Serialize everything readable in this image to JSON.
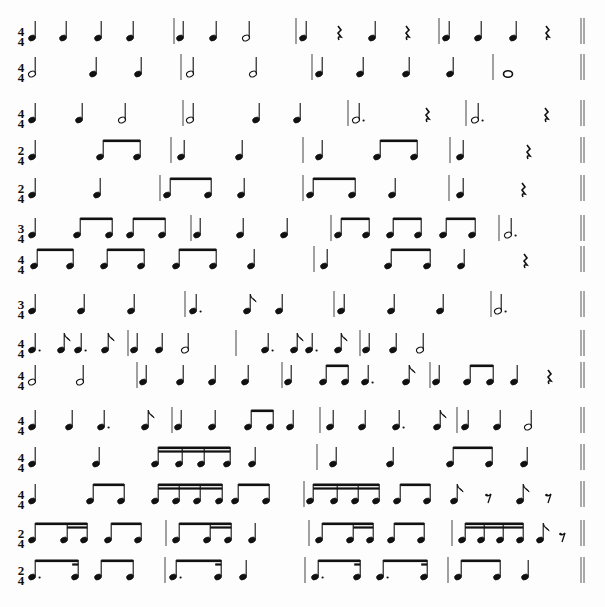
{
  "document": {
    "title": "Rhythm reading exercises",
    "lines": [
      {
        "id": 1,
        "y": 38,
        "time": [
          "4",
          "4"
        ],
        "symbols": [
          {
            "t": "q",
            "x": 32
          },
          {
            "t": "q",
            "x": 63
          },
          {
            "t": "q",
            "x": 98
          },
          {
            "t": "q",
            "x": 130
          },
          {
            "t": "bar",
            "x": 174
          },
          {
            "t": "q",
            "x": 180
          },
          {
            "t": "q",
            "x": 213
          },
          {
            "t": "h",
            "x": 246
          },
          {
            "t": "bar",
            "x": 296
          },
          {
            "t": "q",
            "x": 303
          },
          {
            "t": "qr",
            "x": 339
          },
          {
            "t": "q",
            "x": 372
          },
          {
            "t": "qr",
            "x": 407
          },
          {
            "t": "bar",
            "x": 439
          },
          {
            "t": "q",
            "x": 446
          },
          {
            "t": "q",
            "x": 478
          },
          {
            "t": "q",
            "x": 513
          },
          {
            "t": "qr",
            "x": 547
          },
          {
            "t": "dbl",
            "x": 581
          }
        ]
      },
      {
        "id": 2,
        "y": 74,
        "time": [
          "4",
          "4"
        ],
        "symbols": [
          {
            "t": "h",
            "x": 32
          },
          {
            "t": "q",
            "x": 93
          },
          {
            "t": "q",
            "x": 138
          },
          {
            "t": "bar",
            "x": 181
          },
          {
            "t": "h",
            "x": 190
          },
          {
            "t": "h",
            "x": 253
          },
          {
            "t": "bar",
            "x": 312
          },
          {
            "t": "q",
            "x": 319
          },
          {
            "t": "q",
            "x": 360
          },
          {
            "t": "q",
            "x": 406
          },
          {
            "t": "q",
            "x": 450
          },
          {
            "t": "bar",
            "x": 493
          },
          {
            "t": "w",
            "x": 508
          },
          {
            "t": "dbl",
            "x": 581
          }
        ]
      },
      {
        "id": 3,
        "y": 120,
        "time": [
          "4",
          "4"
        ],
        "symbols": [
          {
            "t": "q",
            "x": 32
          },
          {
            "t": "q",
            "x": 79
          },
          {
            "t": "h",
            "x": 122
          },
          {
            "t": "bar",
            "x": 183
          },
          {
            "t": "h",
            "x": 190
          },
          {
            "t": "q",
            "x": 256
          },
          {
            "t": "q",
            "x": 297
          },
          {
            "t": "bar",
            "x": 348
          },
          {
            "t": "hd",
            "x": 356
          },
          {
            "t": "qr",
            "x": 427
          },
          {
            "t": "bar",
            "x": 466
          },
          {
            "t": "hd",
            "x": 475
          },
          {
            "t": "qr",
            "x": 546
          },
          {
            "t": "dbl",
            "x": 581
          }
        ]
      },
      {
        "id": 4,
        "y": 157,
        "time": [
          "2",
          "4"
        ],
        "symbols": [
          {
            "t": "q",
            "x": 32
          },
          {
            "t": "beam8",
            "x": [
              100,
              137
            ]
          },
          {
            "t": "bar",
            "x": 171
          },
          {
            "t": "q",
            "x": 181
          },
          {
            "t": "q",
            "x": 239
          },
          {
            "t": "bar",
            "x": 303
          },
          {
            "t": "q",
            "x": 319
          },
          {
            "t": "beam8",
            "x": [
              377,
              414
            ]
          },
          {
            "t": "bar",
            "x": 450
          },
          {
            "t": "q",
            "x": 460
          },
          {
            "t": "qr",
            "x": 528
          },
          {
            "t": "dbl",
            "x": 581
          }
        ]
      },
      {
        "id": 5,
        "y": 195,
        "time": [
          "2",
          "4"
        ],
        "symbols": [
          {
            "t": "q",
            "x": 32
          },
          {
            "t": "q",
            "x": 97
          },
          {
            "t": "bar",
            "x": 160
          },
          {
            "t": "beam8",
            "x": [
              167,
              208
            ]
          },
          {
            "t": "q",
            "x": 241
          },
          {
            "t": "bar",
            "x": 303
          },
          {
            "t": "beam8",
            "x": [
              310,
              352
            ]
          },
          {
            "t": "q",
            "x": 392
          },
          {
            "t": "bar",
            "x": 449
          },
          {
            "t": "q",
            "x": 460
          },
          {
            "t": "qr",
            "x": 523
          },
          {
            "t": "dbl",
            "x": 581
          }
        ]
      },
      {
        "id": 6,
        "y": 235,
        "time": [
          "3",
          "4"
        ],
        "symbols": [
          {
            "t": "q",
            "x": 32
          },
          {
            "t": "beam8",
            "x": [
              77,
              109
            ]
          },
          {
            "t": "beam8",
            "x": [
              130,
              162
            ]
          },
          {
            "t": "bar",
            "x": 191
          },
          {
            "t": "q",
            "x": 197
          },
          {
            "t": "q",
            "x": 240
          },
          {
            "t": "q",
            "x": 284
          },
          {
            "t": "bar",
            "x": 331
          },
          {
            "t": "beam8",
            "x": [
              338,
              366
            ]
          },
          {
            "t": "beam8",
            "x": [
              390,
              418
            ]
          },
          {
            "t": "beam8",
            "x": [
              443,
              472
            ]
          },
          {
            "t": "bar",
            "x": 499
          },
          {
            "t": "hd",
            "x": 508
          },
          {
            "t": "dbl",
            "x": 581
          }
        ]
      },
      {
        "id": 7,
        "y": 266,
        "time": [
          "4",
          "4"
        ],
        "symbols": [
          {
            "t": "beam8",
            "x": [
              34,
              70
            ]
          },
          {
            "t": "beam8",
            "x": [
              104,
              141
            ]
          },
          {
            "t": "beam8",
            "x": [
              176,
              213
            ]
          },
          {
            "t": "q",
            "x": 251
          },
          {
            "t": "bar",
            "x": 314
          },
          {
            "t": "q",
            "x": 324
          },
          {
            "t": "beam8",
            "x": [
              388,
              427
            ]
          },
          {
            "t": "q",
            "x": 461
          },
          {
            "t": "qr",
            "x": 525
          },
          {
            "t": "dbl",
            "x": 581
          }
        ]
      },
      {
        "id": 8,
        "y": 311,
        "time": [
          "3",
          "4"
        ],
        "symbols": [
          {
            "t": "q",
            "x": 32
          },
          {
            "t": "q",
            "x": 81
          },
          {
            "t": "q",
            "x": 131
          },
          {
            "t": "bar",
            "x": 185
          },
          {
            "t": "qd",
            "x": 193
          },
          {
            "t": "e",
            "x": 247
          },
          {
            "t": "q",
            "x": 279
          },
          {
            "t": "bar",
            "x": 334
          },
          {
            "t": "q",
            "x": 341
          },
          {
            "t": "q",
            "x": 391
          },
          {
            "t": "q",
            "x": 440
          },
          {
            "t": "bar",
            "x": 491
          },
          {
            "t": "hd",
            "x": 498
          },
          {
            "t": "dbl",
            "x": 581
          }
        ]
      },
      {
        "id": 9,
        "y": 350,
        "time": [
          "4",
          "4"
        ],
        "symbols": [
          {
            "t": "qd",
            "x": 32
          },
          {
            "t": "e",
            "x": 61
          },
          {
            "t": "qd",
            "x": 78
          },
          {
            "t": "e",
            "x": 105
          },
          {
            "t": "bar",
            "x": 128
          },
          {
            "t": "q",
            "x": 134
          },
          {
            "t": "q",
            "x": 159
          },
          {
            "t": "h",
            "x": 185
          },
          {
            "t": "bar",
            "x": 236
          },
          {
            "t": "qd",
            "x": 265
          },
          {
            "t": "e",
            "x": 294
          },
          {
            "t": "qd",
            "x": 309
          },
          {
            "t": "e",
            "x": 338
          },
          {
            "t": "bar",
            "x": 360
          },
          {
            "t": "q",
            "x": 366
          },
          {
            "t": "q",
            "x": 393
          },
          {
            "t": "h",
            "x": 420
          },
          {
            "t": "dbl",
            "x": 581
          }
        ]
      },
      {
        "id": 10,
        "y": 382,
        "time": [
          "4",
          "4"
        ],
        "symbols": [
          {
            "t": "h",
            "x": 32
          },
          {
            "t": "h",
            "x": 80
          },
          {
            "t": "bar",
            "x": 137
          },
          {
            "t": "q",
            "x": 143
          },
          {
            "t": "q",
            "x": 180
          },
          {
            "t": "q",
            "x": 212
          },
          {
            "t": "q",
            "x": 245
          },
          {
            "t": "bar",
            "x": 282
          },
          {
            "t": "q",
            "x": 288
          },
          {
            "t": "beam8",
            "x": [
              323,
              345
            ]
          },
          {
            "t": "qd",
            "x": 365
          },
          {
            "t": "e",
            "x": 406
          },
          {
            "t": "bar",
            "x": 430
          },
          {
            "t": "q",
            "x": 436
          },
          {
            "t": "beam8",
            "x": [
              467,
              490
            ]
          },
          {
            "t": "q",
            "x": 514
          },
          {
            "t": "qr",
            "x": 549
          },
          {
            "t": "dbl",
            "x": 581
          }
        ]
      },
      {
        "id": 11,
        "y": 427,
        "time": [
          "4",
          "4"
        ],
        "symbols": [
          {
            "t": "q",
            "x": 32
          },
          {
            "t": "q",
            "x": 69
          },
          {
            "t": "qd",
            "x": 101
          },
          {
            "t": "e",
            "x": 145
          },
          {
            "t": "bar",
            "x": 172
          },
          {
            "t": "q",
            "x": 178
          },
          {
            "t": "q",
            "x": 212
          },
          {
            "t": "beam8",
            "x": [
              248,
              270
            ]
          },
          {
            "t": "q",
            "x": 290
          },
          {
            "t": "bar",
            "x": 320
          },
          {
            "t": "q",
            "x": 330
          },
          {
            "t": "q",
            "x": 362
          },
          {
            "t": "qd",
            "x": 396
          },
          {
            "t": "e",
            "x": 437
          },
          {
            "t": "bar",
            "x": 457
          },
          {
            "t": "q",
            "x": 465
          },
          {
            "t": "q",
            "x": 497
          },
          {
            "t": "h",
            "x": 528
          },
          {
            "t": "dbl",
            "x": 581
          }
        ]
      },
      {
        "id": 12,
        "y": 464,
        "time": [
          "4",
          "4"
        ],
        "symbols": [
          {
            "t": "q",
            "x": 32
          },
          {
            "t": "q",
            "x": 96
          },
          {
            "t": "beam16",
            "x": [
              155,
              179,
              201,
              227
            ]
          },
          {
            "t": "q",
            "x": 252
          },
          {
            "t": "bar",
            "x": 317
          },
          {
            "t": "q",
            "x": 333
          },
          {
            "t": "q",
            "x": 390
          },
          {
            "t": "beam8",
            "x": [
              450,
              489
            ]
          },
          {
            "t": "q",
            "x": 524
          },
          {
            "t": "dbl",
            "x": 581
          }
        ]
      },
      {
        "id": 13,
        "y": 501,
        "time": [
          "4",
          "4"
        ],
        "symbols": [
          {
            "t": "q",
            "x": 32
          },
          {
            "t": "beam8",
            "x": [
              90,
              121
            ]
          },
          {
            "t": "beam16",
            "x": [
              155,
              176,
              197,
              219
            ]
          },
          {
            "t": "beam8",
            "x": [
              235,
              266
            ]
          },
          {
            "t": "bar",
            "x": 304
          },
          {
            "t": "beam16",
            "x": [
              310,
              334,
              355,
              376
            ]
          },
          {
            "t": "beam8",
            "x": [
              397,
              427
            ]
          },
          {
            "t": "e",
            "x": 454
          },
          {
            "t": "er",
            "x": 488
          },
          {
            "t": "e",
            "x": 520
          },
          {
            "t": "er",
            "x": 548
          },
          {
            "t": "dbl",
            "x": 581
          }
        ]
      },
      {
        "id": 14,
        "y": 540,
        "time": [
          "2",
          "4"
        ],
        "symbols": [
          {
            "t": "beam8_16",
            "x": [
              32,
              64,
              84
            ]
          },
          {
            "t": "beam8",
            "x": [
              108,
              138
            ]
          },
          {
            "t": "bar",
            "x": 166
          },
          {
            "t": "beam8_16",
            "x": [
              176,
              207,
              228
            ]
          },
          {
            "t": "q",
            "x": 252
          },
          {
            "t": "bar",
            "x": 309
          },
          {
            "t": "beam8_16",
            "x": [
              319,
              350,
              370
            ]
          },
          {
            "t": "beam8",
            "x": [
              391,
              421
            ]
          },
          {
            "t": "bar",
            "x": 452
          },
          {
            "t": "beam16",
            "x": [
              462,
              481,
              500,
              520
            ]
          },
          {
            "t": "e",
            "x": 540
          },
          {
            "t": "er",
            "x": 562
          },
          {
            "t": "dbl",
            "x": 581
          }
        ]
      },
      {
        "id": 15,
        "y": 577,
        "time": [
          "2",
          "4"
        ],
        "symbols": [
          {
            "t": "dot16",
            "x": [
              32,
              75
            ]
          },
          {
            "t": "beam8",
            "x": [
              98,
              130
            ]
          },
          {
            "t": "bar",
            "x": 165
          },
          {
            "t": "dot16",
            "x": [
              173,
              218
            ]
          },
          {
            "t": "q",
            "x": 243
          },
          {
            "t": "bar",
            "x": 305
          },
          {
            "t": "dot16",
            "x": [
              315,
              357
            ]
          },
          {
            "t": "dot16",
            "x": [
              380,
              424
            ]
          },
          {
            "t": "bar",
            "x": 448
          },
          {
            "t": "beam8",
            "x": [
              458,
              497
            ]
          },
          {
            "t": "q",
            "x": 525
          },
          {
            "t": "dbl",
            "x": 581
          }
        ]
      }
    ]
  }
}
